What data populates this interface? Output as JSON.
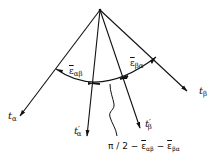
{
  "figure": {
    "type": "shear-strain-angle-diagram",
    "apex": {
      "x": 100,
      "y": 10
    },
    "vectors": [
      {
        "id": "t_alpha",
        "symbol": "t",
        "subscript": "α",
        "prime": "",
        "end": {
          "x": 20,
          "y": 116
        }
      },
      {
        "id": "t_alpha_prime",
        "symbol": "t",
        "subscript": "α",
        "prime": "′",
        "end": {
          "x": 87,
          "y": 136
        }
      },
      {
        "id": "t_beta_prime",
        "symbol": "t",
        "subscript": "β",
        "prime": "′",
        "end": {
          "x": 140,
          "y": 128
        }
      },
      {
        "id": "t_beta",
        "symbol": "t",
        "subscript": "β",
        "prime": "",
        "end": {
          "x": 187,
          "y": 91
        }
      }
    ],
    "angles": [
      {
        "id": "eps_alpha_beta",
        "symbol": "ε",
        "subscript": "αβ",
        "overbar": true
      },
      {
        "id": "eps_beta_alpha",
        "symbol": "ε",
        "subscript": "βα",
        "overbar": true
      }
    ],
    "caption": {
      "prefix": "π / 2 − ",
      "term1_symbol": "ε",
      "term1_sub": "αβ",
      "minus": " − ",
      "term2_symbol": "ε",
      "term2_sub": "βα"
    }
  },
  "labels": {
    "t_alpha": {
      "base": "t",
      "sub": "α",
      "prime": ""
    },
    "t_alpha_prime": {
      "base": "t",
      "sub": "α",
      "prime": "′"
    },
    "t_beta_prime": {
      "base": "t",
      "sub": "β",
      "prime": "′"
    },
    "t_beta": {
      "base": "t",
      "sub": "β",
      "prime": ""
    },
    "eps_ab": {
      "base": "ε",
      "sub": "αβ"
    },
    "eps_ba": {
      "base": "ε",
      "sub": "βα"
    }
  },
  "colors": {
    "stroke": "#111111",
    "background": "#ffffff"
  }
}
